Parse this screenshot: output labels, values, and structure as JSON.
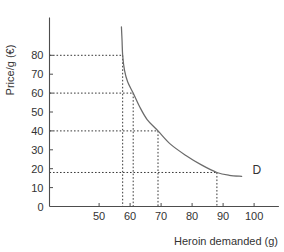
{
  "chart_data": {
    "type": "line",
    "title": "",
    "xlabel": "Heroin demanded (g)",
    "ylabel": "Price/g (€)",
    "xlim": [
      40,
      108
    ],
    "ylim": [
      0,
      100
    ],
    "grid": false,
    "legend": "none",
    "x_ticks": [
      "50",
      "60",
      "70",
      "80",
      "90",
      "100"
    ],
    "x_tick_values": [
      50,
      60,
      70,
      80,
      90,
      100
    ],
    "y_ticks": [
      "0",
      "10",
      "20",
      "30",
      "40",
      "50",
      "60",
      "70",
      "80"
    ],
    "y_tick_values": [
      0,
      10,
      20,
      30,
      40,
      50,
      60,
      70,
      80
    ],
    "series": [
      {
        "name": "D",
        "label": "D",
        "color": "#6b6b6b",
        "points": [
          [
            57.2,
            95
          ],
          [
            57.4,
            88
          ],
          [
            57.6,
            80
          ],
          [
            58.2,
            72
          ],
          [
            59.2,
            66
          ],
          [
            61.0,
            60
          ],
          [
            63.0,
            53
          ],
          [
            65.5,
            46
          ],
          [
            69.0,
            40
          ],
          [
            73.0,
            33
          ],
          [
            78.0,
            27
          ],
          [
            83.0,
            22
          ],
          [
            88.0,
            18
          ],
          [
            92.0,
            16.5
          ],
          [
            96.0,
            16
          ]
        ]
      }
    ],
    "annotations": [
      {
        "text": "D",
        "x": 99.5,
        "y": 17,
        "name": "demand-curve-label"
      }
    ],
    "guides": [
      {
        "name": "guide-price-80",
        "price": 80,
        "quantity": 57.6,
        "price_label": "80"
      },
      {
        "name": "guide-price-60",
        "price": 60,
        "quantity": 61.0,
        "price_label": "60"
      },
      {
        "name": "guide-price-40",
        "price": 40,
        "quantity": 69.0,
        "price_label": "40"
      },
      {
        "name": "guide-price-18",
        "price": 18,
        "quantity": 88.0,
        "price_label": "20"
      }
    ]
  }
}
